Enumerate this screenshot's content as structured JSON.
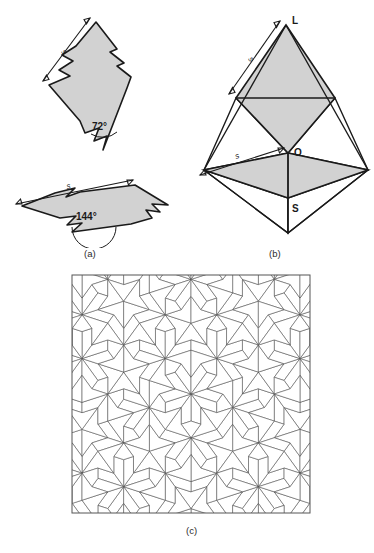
{
  "figure": {
    "cut_off_header_text": "",
    "captions": [
      {
        "id": "a",
        "label": "(a)"
      },
      {
        "id": "b",
        "label": "(b)"
      },
      {
        "id": "c",
        "label": "(c)"
      }
    ]
  },
  "panel_a": {
    "name": "penrose-matching-rule-rhombs",
    "thin_rhomb": {
      "angle_label": "72°",
      "side_label": "s",
      "angle_degrees": 72,
      "fill_color": "#d2d2d2",
      "stroke_color": "#1a1a1a"
    },
    "fat_rhomb": {
      "angle_label": "144°",
      "side_label": "s",
      "angle_degrees": 144,
      "fill_color": "#d2d2d2",
      "stroke_color": "#1a1a1a"
    }
  },
  "panel_b": {
    "name": "rhombus-construction",
    "vertex_labels": [
      {
        "id": "L",
        "label": "L"
      },
      {
        "id": "O",
        "label": "O"
      },
      {
        "id": "S",
        "label": "S"
      }
    ],
    "side_labels": [
      {
        "id": "upper-s",
        "label": "s"
      },
      {
        "id": "lower-s",
        "label": "s"
      }
    ],
    "fill_color": "#d2d2d2",
    "stroke_color": "#1a1a1a"
  },
  "panel_c": {
    "name": "penrose-tiling",
    "tiling_type": "penrose-rhombus-P3",
    "border_color": "#555555",
    "tile_stroke_color": "#4a4a4a",
    "tile_fill_color": "#ffffff",
    "bounds": {
      "x": 72,
      "y": 275,
      "width": 238,
      "height": 238
    }
  }
}
